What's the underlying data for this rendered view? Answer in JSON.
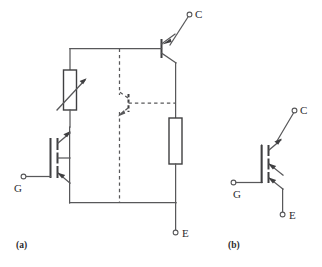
{
  "figure": {
    "background_color": "#ffffff",
    "line_color": "#58585a",
    "device_color": "#3f3f41",
    "label_color": "#2b2b2d"
  },
  "panels": [
    {
      "id": "a",
      "caption": "(a)",
      "description": "IGBT equivalent circuit",
      "terminals": [
        {
          "name": "collector",
          "label": "C",
          "x": 192,
          "y": 14
        },
        {
          "name": "gate",
          "label": "G",
          "x": 14,
          "y": 176
        },
        {
          "name": "emitter",
          "label": "E",
          "x": 183,
          "y": 233
        }
      ],
      "components": [
        {
          "name": "pnp-transistor",
          "type": "bjt-pnp",
          "style": "solid"
        },
        {
          "name": "npn-transistor",
          "type": "bjt-npn",
          "style": "dashed"
        },
        {
          "name": "variable-resistor",
          "type": "resistor-variable",
          "style": "solid"
        },
        {
          "name": "body-resistor",
          "type": "resistor",
          "style": "solid"
        },
        {
          "name": "mosfet",
          "type": "mosfet-n-channel",
          "style": "solid"
        }
      ]
    },
    {
      "id": "b",
      "caption": "(b)",
      "description": "IGBT circuit symbol",
      "terminals": [
        {
          "name": "collector",
          "label": "C",
          "x": 297,
          "y": 110
        },
        {
          "name": "gate",
          "label": "G",
          "x": 224,
          "y": 182
        },
        {
          "name": "emitter",
          "label": "E",
          "x": 274,
          "y": 214
        }
      ],
      "components": [
        {
          "name": "igbt-symbol",
          "type": "igbt",
          "style": "solid"
        }
      ]
    }
  ],
  "labels": {
    "collector": "C",
    "gate": "G",
    "emitter": "E",
    "caption_a": "(a)",
    "caption_b": "(b)"
  }
}
